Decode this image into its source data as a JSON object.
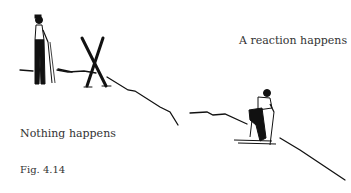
{
  "figure": {
    "caption": "Fig. 4.14",
    "labels": {
      "reaction": "A reaction happens",
      "nothing": "Nothing happens"
    },
    "scenes": [
      {
        "name": "skier-standing",
        "description": "Skier standing on flat snow next to crossed skis stuck upright"
      },
      {
        "name": "skier-descending",
        "description": "Skier crouched starting down the slope"
      }
    ],
    "colors": {
      "ink": "#111111",
      "text": "#333333",
      "background": "#ffffff"
    }
  }
}
